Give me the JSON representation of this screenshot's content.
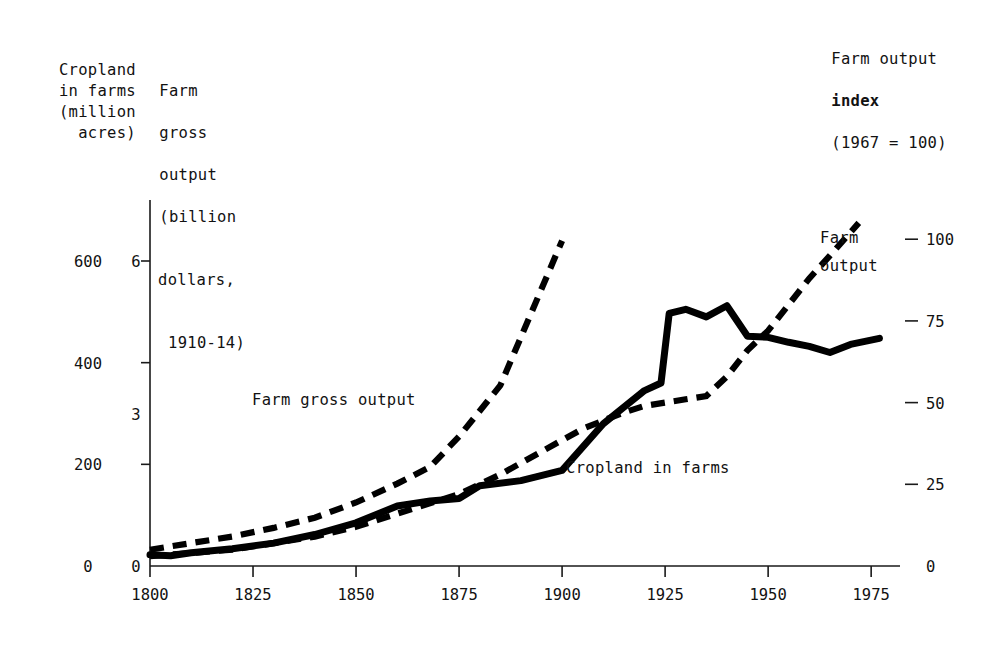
{
  "figure": {
    "left_caption_cropland": "Cropland\nin farms\n(million\nacres)",
    "left_caption_gross_l1": "Farm",
    "left_caption_gross_l2": "gross",
    "left_caption_gross_l3": "output",
    "left_caption_gross_l4": "(billion",
    "left_caption_gross_l5": "dollars,",
    "left_caption_gross_l6": "1910-14)",
    "right_caption_l1": "Farm output",
    "right_caption_l2": "index",
    "right_caption_l3": "(1967 = 100)"
  },
  "chart_data": {
    "type": "line",
    "title": "",
    "xlabel": "",
    "ylabel": "",
    "grid": false,
    "legend_position": "inline-annotations",
    "x_axis": {
      "ticks": [
        1800,
        1825,
        1850,
        1875,
        1900,
        1925,
        1950,
        1975
      ],
      "tick_labels": [
        "1800",
        "1825",
        "1850",
        "1875",
        "1900",
        "1925",
        "1950",
        "1975"
      ],
      "range": [
        1800,
        1982
      ]
    },
    "y_axis_left_cropland": {
      "label": "Cropland in farms (million acres)",
      "ticks": [
        0,
        200,
        400,
        600
      ],
      "tick_labels": [
        "0",
        "200",
        "400",
        "600"
      ],
      "range": [
        0,
        720
      ]
    },
    "y_axis_left_gross": {
      "label": "Farm gross output (billion dollars, 1910-14)",
      "ticks": [
        0,
        3,
        6
      ],
      "tick_labels": [
        "0",
        "3",
        "6"
      ],
      "range": [
        0,
        7.2
      ]
    },
    "y_axis_right_index": {
      "label": "Farm output index (1967 = 100)",
      "ticks": [
        0,
        25,
        50,
        75,
        100
      ],
      "tick_labels": [
        "0",
        "25",
        "50",
        "75",
        "100"
      ],
      "range": [
        0,
        112
      ]
    },
    "series": [
      {
        "name": "Cropland in farms",
        "style": "solid",
        "axis": "left-cropland",
        "units": "million acres",
        "annotation": "Cropland in farms",
        "points": [
          [
            1800,
            22
          ],
          [
            1805,
            20
          ],
          [
            1810,
            26
          ],
          [
            1820,
            34
          ],
          [
            1830,
            45
          ],
          [
            1840,
            62
          ],
          [
            1850,
            85
          ],
          [
            1860,
            118
          ],
          [
            1868,
            128
          ],
          [
            1875,
            133
          ],
          [
            1880,
            158
          ],
          [
            1890,
            168
          ],
          [
            1900,
            188
          ],
          [
            1910,
            280
          ],
          [
            1920,
            345
          ],
          [
            1924,
            360
          ],
          [
            1926,
            497
          ],
          [
            1930,
            505
          ],
          [
            1935,
            490
          ],
          [
            1940,
            512
          ],
          [
            1945,
            452
          ],
          [
            1950,
            450
          ],
          [
            1955,
            440
          ],
          [
            1960,
            432
          ],
          [
            1965,
            420
          ],
          [
            1970,
            436
          ],
          [
            1977,
            448
          ]
        ]
      },
      {
        "name": "Farm gross output",
        "style": "dashed",
        "axis": "left-gross",
        "units": "billion dollars (1910-14)",
        "annotation": "Farm gross output",
        "points": [
          [
            1800,
            0.32
          ],
          [
            1810,
            0.45
          ],
          [
            1820,
            0.58
          ],
          [
            1830,
            0.75
          ],
          [
            1840,
            0.95
          ],
          [
            1850,
            1.25
          ],
          [
            1860,
            1.62
          ],
          [
            1868,
            1.95
          ],
          [
            1875,
            2.55
          ],
          [
            1885,
            3.55
          ],
          [
            1900,
            6.4
          ]
        ]
      },
      {
        "name": "Farm output",
        "style": "dashed",
        "axis": "right-index",
        "units": "index, 1967 = 100",
        "annotation": "Farm output",
        "points": [
          [
            1800,
            3
          ],
          [
            1810,
            4
          ],
          [
            1820,
            5
          ],
          [
            1830,
            7
          ],
          [
            1840,
            9
          ],
          [
            1850,
            12
          ],
          [
            1860,
            16
          ],
          [
            1870,
            20
          ],
          [
            1875,
            22
          ],
          [
            1885,
            28
          ],
          [
            1895,
            35
          ],
          [
            1905,
            42
          ],
          [
            1915,
            47
          ],
          [
            1920,
            49
          ],
          [
            1925,
            50
          ],
          [
            1930,
            51
          ],
          [
            1935,
            52
          ],
          [
            1940,
            58
          ],
          [
            1945,
            66
          ],
          [
            1950,
            72
          ],
          [
            1955,
            80
          ],
          [
            1960,
            88
          ],
          [
            1965,
            95
          ],
          [
            1972,
            105
          ]
        ]
      }
    ]
  }
}
